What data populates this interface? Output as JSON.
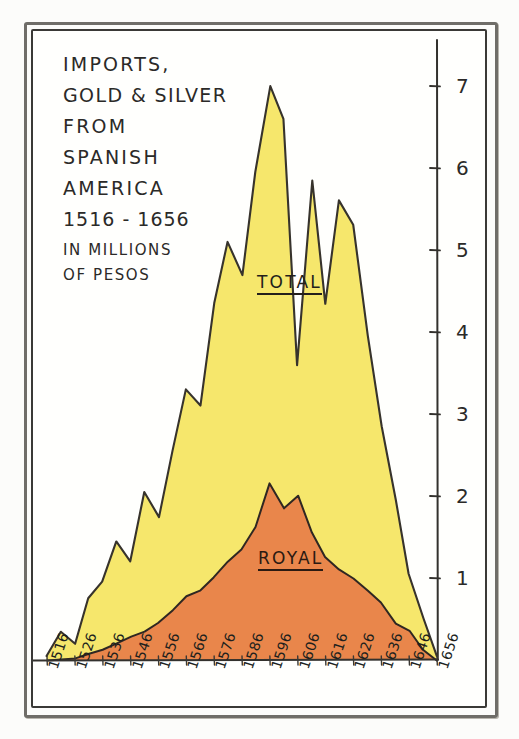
{
  "title": {
    "line1": "IMPORTS,",
    "line2": "GOLD & SILVER",
    "line3": "FROM",
    "line4": "SPANISH",
    "line5": "AMERICA",
    "line6": "1516 - 1656",
    "line7": "IN MILLIONS",
    "line8": "OF PESOS"
  },
  "labels": {
    "total": "TOTAL",
    "royal": "ROYAL"
  },
  "colors": {
    "total_fill": "#f5e55f",
    "royal_fill": "#e8814a",
    "ink": "#2b2a28",
    "paper": "#fffffd",
    "frame": "#3a3936"
  },
  "chart_data": {
    "type": "area",
    "title": "IMPORTS, GOLD & SILVER FROM SPANISH AMERICA 1516 - 1656",
    "subtitle": "IN MILLIONS OF PESOS",
    "xlabel": "",
    "ylabel": "IN MILLIONS OF PESOS",
    "ylim": [
      0,
      7.4
    ],
    "xlim": [
      1516,
      1656
    ],
    "grid": false,
    "legend_position": "inline-on-series",
    "yticks": [
      1,
      2,
      3,
      4,
      5,
      6,
      7
    ],
    "ytick_labels": [
      "1",
      "2",
      "3",
      "4",
      "5",
      "6",
      "7"
    ],
    "xticks": [
      1516,
      1526,
      1536,
      1546,
      1556,
      1566,
      1576,
      1586,
      1596,
      1606,
      1616,
      1626,
      1636,
      1646,
      1656
    ],
    "xtick_labels": [
      "1516",
      "1526",
      "1536",
      "1546",
      "1556",
      "1566",
      "1576",
      "1586",
      "1596",
      "1606",
      "1616",
      "1626",
      "1636",
      "1646",
      "1656"
    ],
    "x": [
      1516,
      1521,
      1526,
      1531,
      1536,
      1541,
      1546,
      1551,
      1556,
      1561,
      1566,
      1571,
      1576,
      1581,
      1586,
      1591,
      1596,
      1601,
      1606,
      1611,
      1616,
      1621,
      1626,
      1631,
      1636,
      1641,
      1646,
      1651,
      1656
    ],
    "series": [
      {
        "name": "TOTAL",
        "color": "#f5e55f",
        "values": [
          0.05,
          0.35,
          0.2,
          0.75,
          0.95,
          1.45,
          1.2,
          2.05,
          1.75,
          2.55,
          3.3,
          3.1,
          4.35,
          5.1,
          4.7,
          5.95,
          7.0,
          6.6,
          3.6,
          5.85,
          4.35,
          5.6,
          5.3,
          3.95,
          2.85,
          1.95,
          1.05,
          0.5,
          0.05
        ]
      },
      {
        "name": "ROYAL",
        "color": "#e8814a",
        "values": [
          0.0,
          0.0,
          0.02,
          0.08,
          0.12,
          0.2,
          0.28,
          0.35,
          0.45,
          0.6,
          0.78,
          0.85,
          1.0,
          1.2,
          1.35,
          1.62,
          2.15,
          1.85,
          2.0,
          1.55,
          1.25,
          1.1,
          1.0,
          0.85,
          0.7,
          0.45,
          0.35,
          0.12,
          0.0
        ]
      }
    ]
  }
}
